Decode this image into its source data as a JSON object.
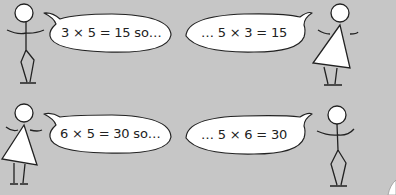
{
  "scene": {
    "background": "#c6c6c6",
    "rows": [
      {
        "left": {
          "figure": "stick-figure-boy",
          "speech": "3 × 5 = 15 so…"
        },
        "right": {
          "figure": "stick-figure-girl",
          "speech": "…  5 × 3 = 15"
        }
      },
      {
        "left": {
          "figure": "stick-figure-girl",
          "speech": "6 × 5 = 30 so…"
        },
        "right": {
          "figure": "stick-figure-boy",
          "speech": "…  5 × 6 = 30"
        }
      }
    ]
  }
}
